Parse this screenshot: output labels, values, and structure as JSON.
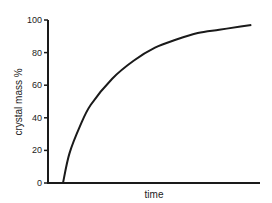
{
  "chart_data": {
    "type": "line",
    "title": "",
    "xlabel": "time",
    "ylabel": "crystal mass %",
    "ylim": [
      0,
      100
    ],
    "yticks": [
      0,
      20,
      40,
      60,
      80,
      100
    ],
    "ytick_labels": [
      "0",
      "20",
      "40",
      "60",
      "80",
      "100"
    ],
    "xticks": [],
    "grid": false,
    "legend": null,
    "series": [
      {
        "name": "crystal mass",
        "x": [
          0.07,
          0.1,
          0.15,
          0.2,
          0.3,
          0.4,
          0.5,
          0.6,
          0.7,
          0.8,
          0.9,
          0.95
        ],
        "values": [
          0,
          18,
          35,
          48,
          64,
          75,
          83,
          88,
          92,
          94,
          96,
          97
        ]
      }
    ],
    "colors": {
      "line": "#1a1a1a",
      "axis": "#1a1a1a"
    }
  }
}
